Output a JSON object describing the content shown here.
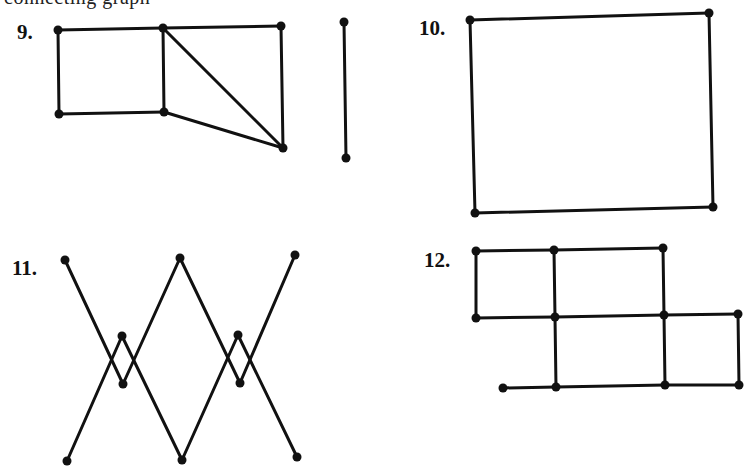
{
  "page": {
    "clipped_header_text": "connecting graph"
  },
  "exercises": [
    {
      "label": "9.",
      "label_pos": [
        17,
        22
      ],
      "nodes": {
        "A": [
          58,
          30
        ],
        "B": [
          163,
          28
        ],
        "C": [
          281,
          26
        ],
        "D": [
          59,
          114
        ],
        "E": [
          164,
          112
        ],
        "F": [
          283,
          148
        ],
        "G": [
          344,
          22
        ],
        "H": [
          346,
          158
        ]
      },
      "edges": [
        [
          "A",
          "B"
        ],
        [
          "B",
          "C"
        ],
        [
          "A",
          "D"
        ],
        [
          "D",
          "E"
        ],
        [
          "B",
          "E"
        ],
        [
          "B",
          "F"
        ],
        [
          "E",
          "F"
        ],
        [
          "C",
          "F"
        ],
        [
          "G",
          "H"
        ]
      ]
    },
    {
      "label": "10.",
      "label_pos": [
        419,
        18
      ],
      "nodes": {
        "A": [
          470,
          20
        ],
        "B": [
          709,
          13
        ],
        "C": [
          475,
          213
        ],
        "D": [
          713,
          207
        ]
      },
      "edges": [
        [
          "A",
          "B"
        ],
        [
          "B",
          "D"
        ],
        [
          "D",
          "C"
        ],
        [
          "C",
          "A"
        ]
      ]
    },
    {
      "label": "11.",
      "label_pos": [
        12,
        258
      ],
      "nodes": {
        "TL": [
          65,
          260
        ],
        "TM": [
          180,
          258
        ],
        "TR": [
          295,
          255
        ],
        "BL": [
          67,
          461
        ],
        "BM": [
          182,
          460
        ],
        "BR": [
          297,
          457
        ],
        "LU": [
          122,
          336
        ],
        "LD": [
          123,
          384
        ],
        "RU": [
          238,
          335
        ],
        "RD": [
          240,
          383
        ]
      },
      "edges": [
        [
          "TL",
          "LD"
        ],
        [
          "LD",
          "TM"
        ],
        [
          "BL",
          "LU"
        ],
        [
          "LU",
          "BM"
        ],
        [
          "TM",
          "RD"
        ],
        [
          "RD",
          "TR"
        ],
        [
          "BM",
          "RU"
        ],
        [
          "RU",
          "BR"
        ]
      ]
    },
    {
      "label": "12.",
      "label_pos": [
        424,
        250
      ],
      "nodes": {
        "T1": [
          476,
          251
        ],
        "T2": [
          554,
          250
        ],
        "T3": [
          663,
          248
        ],
        "M1": [
          476,
          318
        ],
        "M2": [
          555,
          317
        ],
        "M3": [
          664,
          315
        ],
        "M4": [
          738,
          314
        ],
        "B0": [
          503,
          388
        ],
        "B2": [
          556,
          387
        ],
        "B3": [
          665,
          385
        ],
        "B4": [
          739,
          385
        ]
      },
      "edges": [
        [
          "T1",
          "T2"
        ],
        [
          "T2",
          "T3"
        ],
        [
          "T1",
          "M1"
        ],
        [
          "T2",
          "M2"
        ],
        [
          "T3",
          "M3"
        ],
        [
          "M1",
          "M2"
        ],
        [
          "M2",
          "M3"
        ],
        [
          "M3",
          "M4"
        ],
        [
          "M2",
          "B2"
        ],
        [
          "M3",
          "B3"
        ],
        [
          "M4",
          "B4"
        ],
        [
          "B0",
          "B2"
        ],
        [
          "B2",
          "B3"
        ],
        [
          "B3",
          "B4"
        ]
      ]
    }
  ]
}
